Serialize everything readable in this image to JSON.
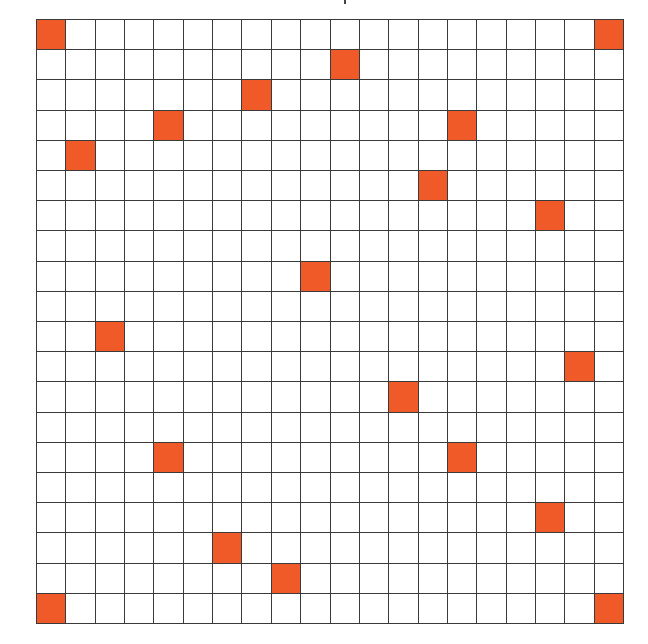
{
  "diagram": {
    "type": "grid",
    "rows": 20,
    "cols": 20,
    "colors": {
      "filled": "#F05A28",
      "empty": "#FFFFFF",
      "line": "#3A3A3A"
    },
    "filled_cells": [
      {
        "row": 0,
        "col": 0
      },
      {
        "row": 0,
        "col": 19
      },
      {
        "row": 1,
        "col": 10
      },
      {
        "row": 2,
        "col": 7
      },
      {
        "row": 3,
        "col": 4
      },
      {
        "row": 3,
        "col": 14
      },
      {
        "row": 4,
        "col": 1
      },
      {
        "row": 5,
        "col": 13
      },
      {
        "row": 6,
        "col": 17
      },
      {
        "row": 8,
        "col": 9
      },
      {
        "row": 10,
        "col": 2
      },
      {
        "row": 11,
        "col": 18
      },
      {
        "row": 12,
        "col": 12
      },
      {
        "row": 14,
        "col": 4
      },
      {
        "row": 14,
        "col": 14
      },
      {
        "row": 16,
        "col": 17
      },
      {
        "row": 17,
        "col": 6
      },
      {
        "row": 18,
        "col": 8
      },
      {
        "row": 19,
        "col": 0
      },
      {
        "row": 19,
        "col": 19
      }
    ],
    "filled_count": 20
  }
}
